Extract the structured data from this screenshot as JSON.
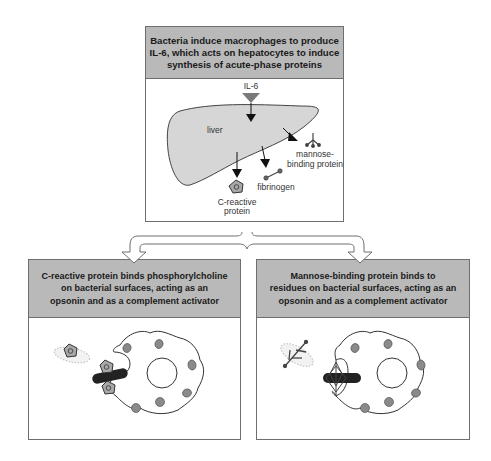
{
  "top_panel": {
    "header": "Bacteria induce macrophages to produce\nIL-6, which acts on hepatocytes to induce\nsynthesis of acute-phase proteins",
    "labels": {
      "il6": "IL-6",
      "liver": "liver",
      "mbl_line1": "mannose-",
      "mbl_line2": "binding protein",
      "fibrinogen": "fibrinogen",
      "crp_line1": "C-reactive",
      "crp_line2": "protein"
    }
  },
  "left_panel": {
    "header": "C-reactive protein binds phosphorylcholine\non bacterial surfaces, acting as an\nopsonin and as a complement activator"
  },
  "right_panel": {
    "header": "Mannose-binding protein binds to\nresidues on bacterial surfaces, acting as an\nopsonin and as a complement activator"
  },
  "colors": {
    "header_fill": "#b9b9b9",
    "liver_fill": "#d6d6d6",
    "granule_fill": "#8a8a8a",
    "bacterium": "#222222",
    "il6_triangle": "#7a7a7a"
  }
}
